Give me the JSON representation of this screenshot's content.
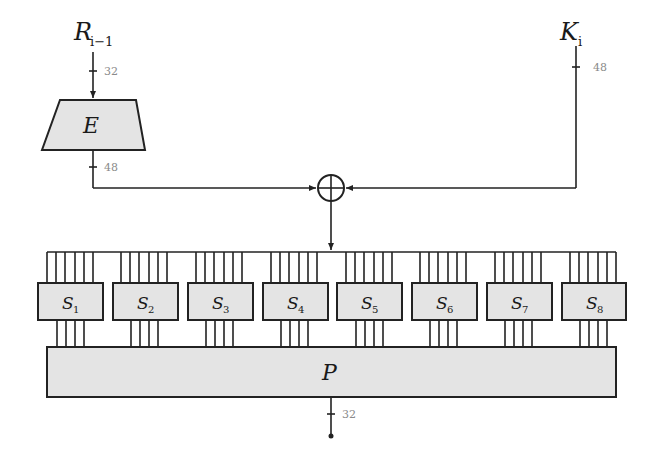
{
  "diagram": {
    "inputs": {
      "r": {
        "label": "R",
        "subscript": "i−1",
        "width": "32"
      },
      "k": {
        "label": "K",
        "subscript": "i",
        "width": "48"
      }
    },
    "expansion": {
      "label": "E",
      "output_width": "48"
    },
    "xor": {
      "symbol": "⊕"
    },
    "sboxes": [
      {
        "label": "S",
        "subscript": "1"
      },
      {
        "label": "S",
        "subscript": "2"
      },
      {
        "label": "S",
        "subscript": "3"
      },
      {
        "label": "S",
        "subscript": "4"
      },
      {
        "label": "S",
        "subscript": "5"
      },
      {
        "label": "S",
        "subscript": "6"
      },
      {
        "label": "S",
        "subscript": "7"
      },
      {
        "label": "S",
        "subscript": "8"
      }
    ],
    "permutation": {
      "label": "P",
      "output_width": "32"
    },
    "colors": {
      "box_fill": "#e4e4e4",
      "stroke": "#222222",
      "width_label": "#8a8a8a"
    }
  }
}
